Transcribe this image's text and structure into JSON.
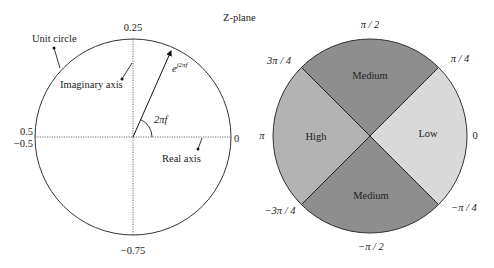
{
  "title": "Z-plane",
  "left_diagram": {
    "labels": {
      "top": "0.25",
      "bottom": "−0.75",
      "left_upper": "0.5",
      "left_lower": "−0.5",
      "right": "0",
      "unit_circle": "Unit circle",
      "imaginary_axis": "Imaginary axis",
      "real_axis": "Real axis",
      "vector_base": "e",
      "vector_exponent": "j2πf",
      "angle": "2πf"
    }
  },
  "right_diagram": {
    "regions": [
      {
        "name": "Medium",
        "position": "top",
        "color": "#8e8e8e"
      },
      {
        "name": "High",
        "position": "left",
        "color": "#b3b3b3"
      },
      {
        "name": "Low",
        "position": "right",
        "color": "#d9d9d9"
      },
      {
        "name": "Medium",
        "position": "bottom",
        "color": "#8e8e8e"
      }
    ],
    "angle_labels": {
      "top": "π / 2",
      "top_left": "3π / 4",
      "top_right": "π / 4",
      "left": "π",
      "right": "0",
      "bottom_left": "−3π / 4",
      "bottom_right": "−π / 4",
      "bottom": "−π / 2"
    }
  }
}
